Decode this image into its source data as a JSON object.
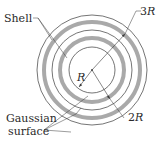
{
  "diagram": {
    "type": "concentric-shells",
    "center": {
      "x": 92,
      "y": 70
    },
    "labels": {
      "shell": "Shell",
      "gaussian_line1": "Gaussian",
      "gaussian_line2": "surface",
      "r_inner": "R",
      "r_2": "2",
      "r_2_var": "R",
      "r_3": "3",
      "r_3_var": "R"
    },
    "circles": [
      {
        "role": "gaussian-surface-inner",
        "radius": 23,
        "style": "thin"
      },
      {
        "role": "shell-inner",
        "radius": 32,
        "style": "thick-gray"
      },
      {
        "role": "gaussian-surface-middle",
        "radius": 40,
        "style": "thin"
      },
      {
        "role": "shell-outer",
        "radius": 48,
        "style": "thick-gray"
      },
      {
        "role": "gaussian-surface-outer",
        "radius": 55,
        "style": "thin"
      }
    ],
    "colors": {
      "line": "#3a3a3a",
      "shell": "#a9a9a9",
      "text": "#2a2a2a",
      "background": "#ffffff"
    }
  }
}
